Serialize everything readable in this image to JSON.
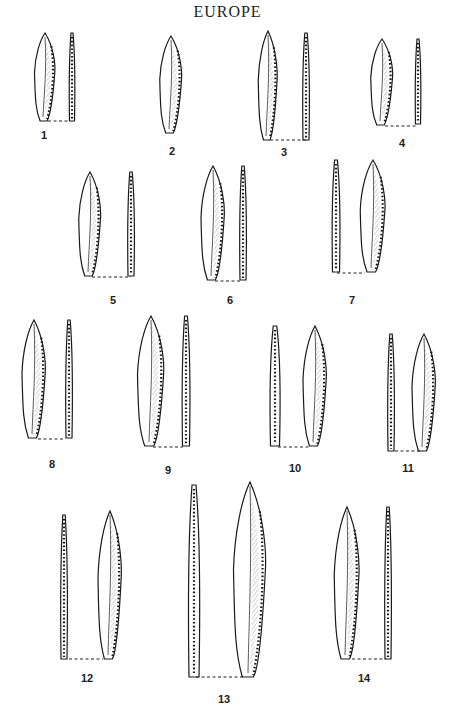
{
  "page": {
    "title": "EUROPE",
    "background": "#ffffff",
    "ink": "#1a1a1a"
  },
  "artifacts": [
    {
      "label": "1",
      "label_x": 44,
      "label_y": 137,
      "views": [
        {
          "type": "face",
          "cx": 45,
          "top": 33,
          "bottom": 121,
          "w": 14
        },
        {
          "type": "profile",
          "cx": 72,
          "top": 33,
          "bottom": 121,
          "w": 5
        }
      ],
      "dash": [
        48,
        121,
        70
      ]
    },
    {
      "label": "2",
      "label_x": 172,
      "label_y": 153,
      "views": [
        {
          "type": "face",
          "cx": 171,
          "top": 36,
          "bottom": 133,
          "w": 15
        }
      ],
      "dash": null
    },
    {
      "label": "3",
      "label_x": 284,
      "label_y": 154,
      "views": [
        {
          "type": "face",
          "cx": 268,
          "top": 31,
          "bottom": 140,
          "w": 13
        },
        {
          "type": "profile",
          "cx": 306,
          "top": 33,
          "bottom": 140,
          "w": 6
        }
      ],
      "dash": [
        270,
        140,
        306
      ]
    },
    {
      "label": "4",
      "label_x": 402,
      "label_y": 145,
      "views": [
        {
          "type": "face",
          "cx": 382,
          "top": 39,
          "bottom": 125,
          "w": 15
        },
        {
          "type": "profile",
          "cx": 418,
          "top": 39,
          "bottom": 124,
          "w": 5
        }
      ],
      "dash": [
        385,
        126,
        417
      ]
    },
    {
      "label": "5",
      "label_x": 113,
      "label_y": 302,
      "views": [
        {
          "type": "face",
          "cx": 90,
          "top": 172,
          "bottom": 276,
          "w": 15
        },
        {
          "type": "profile",
          "cx": 131,
          "top": 172,
          "bottom": 276,
          "w": 6
        }
      ],
      "dash": [
        92,
        277,
        131
      ]
    },
    {
      "label": "6",
      "label_x": 230,
      "label_y": 302,
      "views": [
        {
          "type": "face",
          "cx": 213,
          "top": 166,
          "bottom": 280,
          "w": 16
        },
        {
          "type": "profile",
          "cx": 243,
          "top": 166,
          "bottom": 280,
          "w": 6
        }
      ],
      "dash": [
        215,
        281,
        241
      ]
    },
    {
      "label": "7",
      "label_x": 352,
      "label_y": 302,
      "views": [
        {
          "type": "profile",
          "cx": 336,
          "top": 160,
          "bottom": 272,
          "w": 7
        },
        {
          "type": "face",
          "cx": 373,
          "top": 160,
          "bottom": 272,
          "w": 17
        }
      ],
      "dash": [
        337,
        273,
        365
      ]
    },
    {
      "label": "8",
      "label_x": 52,
      "label_y": 466,
      "views": [
        {
          "type": "face",
          "cx": 34,
          "top": 320,
          "bottom": 438,
          "w": 16
        },
        {
          "type": "profile",
          "cx": 69,
          "top": 320,
          "bottom": 438,
          "w": 6
        }
      ],
      "dash": [
        38,
        439,
        65
      ]
    },
    {
      "label": "9",
      "label_x": 168,
      "label_y": 472,
      "views": [
        {
          "type": "face",
          "cx": 151,
          "top": 316,
          "bottom": 446,
          "w": 18
        },
        {
          "type": "profile",
          "cx": 186,
          "top": 316,
          "bottom": 446,
          "w": 7
        }
      ],
      "dash": [
        153,
        447,
        183
      ]
    },
    {
      "label": "10",
      "label_x": 295,
      "label_y": 470,
      "views": [
        {
          "type": "profile",
          "cx": 275,
          "top": 326,
          "bottom": 446,
          "w": 9
        },
        {
          "type": "face",
          "cx": 315,
          "top": 326,
          "bottom": 446,
          "w": 16
        }
      ],
      "dash": [
        278,
        447,
        311
      ]
    },
    {
      "label": "11",
      "label_x": 408,
      "label_y": 470,
      "views": [
        {
          "type": "profile",
          "cx": 391,
          "top": 334,
          "bottom": 451,
          "w": 6
        },
        {
          "type": "face",
          "cx": 424,
          "top": 334,
          "bottom": 451,
          "w": 16
        }
      ],
      "dash": [
        395,
        451,
        423
      ]
    },
    {
      "label": "12",
      "label_x": 87,
      "label_y": 680,
      "views": [
        {
          "type": "profile",
          "cx": 64,
          "top": 515,
          "bottom": 659,
          "w": 6
        },
        {
          "type": "face",
          "cx": 110,
          "top": 511,
          "bottom": 659,
          "w": 16
        }
      ],
      "dash": [
        69,
        659,
        103
      ]
    },
    {
      "label": "13",
      "label_x": 224,
      "label_y": 701,
      "views": [
        {
          "type": "profile",
          "cx": 194,
          "top": 485,
          "bottom": 677,
          "w": 10
        },
        {
          "type": "face",
          "cx": 250,
          "top": 482,
          "bottom": 677,
          "w": 22
        }
      ],
      "dash": [
        196,
        677,
        245
      ]
    },
    {
      "label": "14",
      "label_x": 364,
      "label_y": 680,
      "views": [
        {
          "type": "face",
          "cx": 347,
          "top": 507,
          "bottom": 659,
          "w": 17
        },
        {
          "type": "profile",
          "cx": 388,
          "top": 507,
          "bottom": 659,
          "w": 6
        }
      ],
      "dash": [
        352,
        659,
        386
      ]
    }
  ]
}
